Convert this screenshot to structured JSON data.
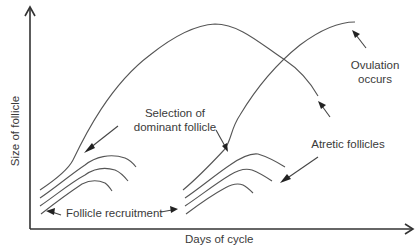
{
  "diagram": {
    "axes": {
      "x_label": "Days of cycle",
      "y_label": "Size of follicle"
    },
    "annotations": {
      "selection_line1": "Selection of",
      "selection_line2": "dominant follicle",
      "ovulation_line1": "Ovulation",
      "ovulation_line2": "occurs",
      "atretic": "Atretic follicles",
      "recruitment": "Follicle recruitment"
    },
    "colors": {
      "line": "#555555",
      "axis": "#333333",
      "text": "#3a3a3a",
      "background": "#ffffff"
    }
  }
}
